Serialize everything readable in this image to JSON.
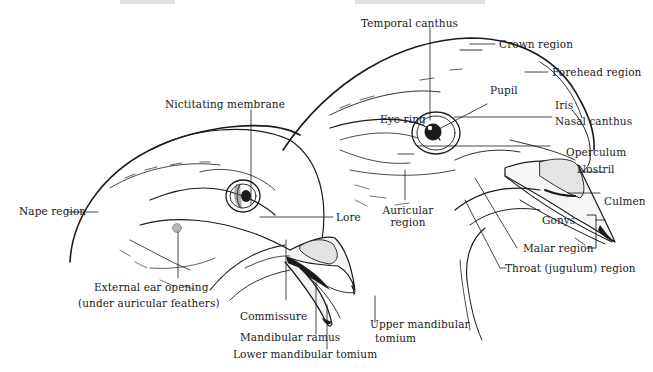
{
  "figure": {
    "colors": {
      "ink": "#1a1a1a",
      "shade": "#9a9a9a",
      "background": "#ffffff"
    }
  },
  "left_head": {
    "labels": {
      "nictitating_membrane": "Nictitating membrane",
      "nape_region": "Nape region",
      "lore": "Lore",
      "external_ear_line1": "External ear opening",
      "external_ear_line2": "(under auricular feathers)",
      "commissure": "Commissure",
      "mandibular_ramus": "Mandibular ramus",
      "lower_mandibular_tomium": "Lower mandibular tomium",
      "upper_mandibular_tomium_line1": "Upper mandibular",
      "upper_mandibular_tomium_line2": "tomium"
    }
  },
  "right_head": {
    "labels": {
      "temporal_canthus": "Temporal canthus",
      "crown_region": "Crown region",
      "forehead_region": "Forehead region",
      "pupil": "Pupil",
      "iris": "Iris",
      "eye_ring": "Eye ring",
      "nasal_canthus": "Nasal canthus",
      "operculum": "Operculum",
      "nostril": "Nostril",
      "culmen": "Culmen",
      "gonys": "Gonys",
      "auricular_region_line1": "Auricular",
      "auricular_region_line2": "region",
      "malar_region": "Malar region",
      "throat_region": "Throat (jugulum) region"
    }
  }
}
